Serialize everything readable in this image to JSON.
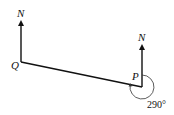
{
  "diagram": {
    "type": "bearing-diagram",
    "points": {
      "Q": {
        "label": "Q",
        "north_label": "N"
      },
      "P": {
        "label": "P",
        "north_label": "N"
      }
    },
    "angle": {
      "at": "P",
      "value": "290°",
      "from": "north",
      "direction": "clockwise",
      "to": "Q"
    },
    "colors": {
      "line": "#111111",
      "background": "#ffffff"
    }
  }
}
